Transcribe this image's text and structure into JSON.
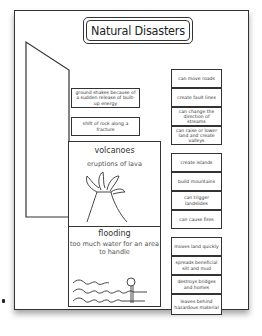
{
  "title": "Natural Disasters",
  "definitions": [
    "ground shakes because of a sudden release of built-up energy",
    "shift of rock along a fracture"
  ],
  "panels": [
    {
      "heading": "volcanoes",
      "subtitle": "eruptions of lava",
      "illustration": "volcano-drawing"
    },
    {
      "heading": "flooding",
      "subtitle": "too much water for an area to handle",
      "illustration": "flood-waves-drawing"
    }
  ],
  "effect_groups": [
    [
      "can move roads",
      "create fault lines",
      "can change the direction of streams",
      "can raise or lower land and create valleys"
    ],
    [
      "create islands",
      "build mountains",
      "can trigger landslides",
      "can cause fires"
    ],
    [
      "moves land quickly",
      "spreads beneficial silt and mud",
      "destroys bridges and homes",
      "leaves behind hazardous material"
    ]
  ]
}
